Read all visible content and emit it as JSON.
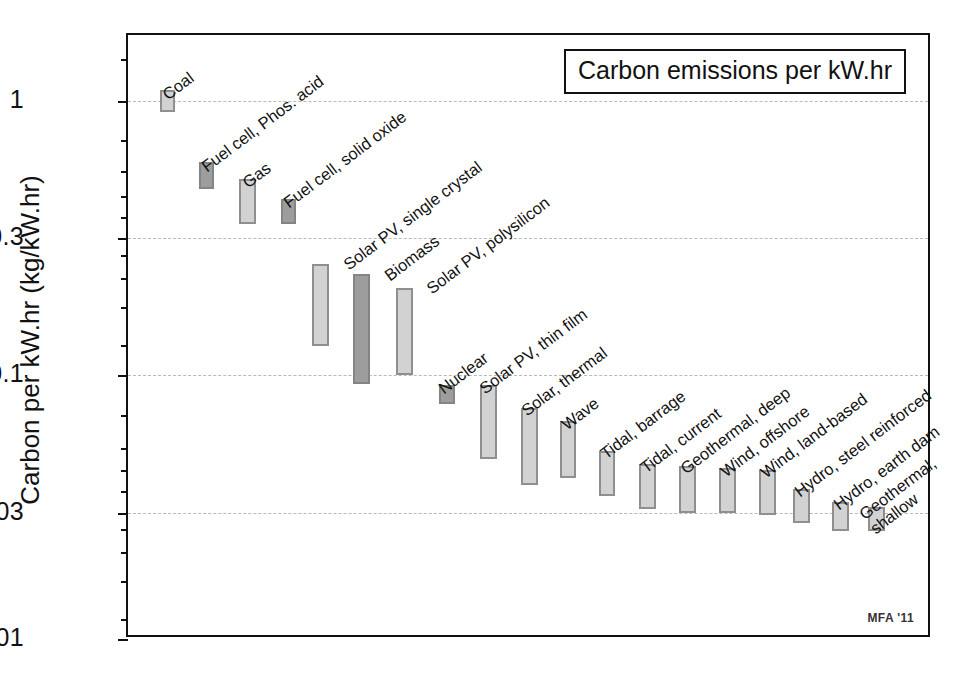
{
  "figure": {
    "title_box": "Carbon emissions per kW.hr",
    "credit": "MFA '11",
    "y_axis_title": "Carbon per kW.hr (kg/kW.hr)"
  },
  "chart_data": {
    "type": "bar",
    "subtype": "floating-range-bar",
    "title": "Carbon emissions per kW.hr",
    "xlabel": "",
    "ylabel": "Carbon per kW.hr (kg/kW.hr)",
    "yscale": "log",
    "ylim": [
      0.01,
      1.7
    ],
    "ytick_labels": [
      "1",
      "0.3",
      "0.1",
      "0.03",
      "0.01"
    ],
    "ytick_values": [
      1,
      0.3,
      0.1,
      0.03,
      0.01
    ],
    "grid": true,
    "grid_style": "dashed-horizontal",
    "legend": "none",
    "units": "kg CO2 per kW.hr",
    "categories": [
      "Coal",
      "Fuel cell, Phos. acid",
      "Gas",
      "Fuel cell, solid oxide",
      "Solar PV, single crystal",
      "Biomass",
      "Solar PV, polysilicon",
      "Nuclear",
      "Solar PV, thin film",
      "Solar, thermal",
      "Wave",
      "Tidal, barrage",
      "Tidal, current",
      "Geothermal, deep",
      "Wind, offshore",
      "Wind, land-based",
      "Hydro, steel reinforced",
      "Hydro, earth dam",
      "Geothermal, shallow"
    ],
    "ranges": [
      {
        "label": "Coal",
        "low": 0.93,
        "high": 1.12,
        "shade": "light"
      },
      {
        "label": "Fuel cell, Phos. acid",
        "low": 0.47,
        "high": 0.57,
        "shade": "dark"
      },
      {
        "label": "Gas",
        "low": 0.335,
        "high": 0.52,
        "shade": "light"
      },
      {
        "label": "Fuel cell, solid oxide",
        "low": 0.335,
        "high": 0.405,
        "shade": "dark"
      },
      {
        "label": "Solar PV, single crystal",
        "low": 0.125,
        "high": 0.245,
        "shade": "light"
      },
      {
        "label": "Biomass",
        "low": 0.085,
        "high": 0.24,
        "shade": "dark"
      },
      {
        "label": "Solar PV, polysilicon",
        "low": 0.1,
        "high": 0.215,
        "shade": "light"
      },
      {
        "label": "Nuclear",
        "low": 0.073,
        "high": 0.092,
        "shade": "dark"
      },
      {
        "label": "Solar PV, thin film",
        "low": 0.05,
        "high": 0.092,
        "shade": "light"
      },
      {
        "label": "Solar, thermal",
        "low": 0.04,
        "high": 0.074,
        "shade": "light"
      },
      {
        "label": "Wave",
        "low": 0.04,
        "high": 0.06,
        "shade": "light"
      },
      {
        "label": "Tidal, barrage",
        "low": 0.033,
        "high": 0.047,
        "shade": "light"
      },
      {
        "label": "Tidal, current",
        "low": 0.034,
        "high": 0.045,
        "shade": "light"
      },
      {
        "label": "Geothermal, deep",
        "low": 0.033,
        "high": 0.044,
        "shade": "light"
      },
      {
        "label": "Wind, offshore",
        "low": 0.033,
        "high": 0.043,
        "shade": "light"
      },
      {
        "label": "Wind, land-based",
        "low": 0.032,
        "high": 0.043,
        "shade": "light"
      },
      {
        "label": "Hydro, steel reinforced",
        "low": 0.0295,
        "high": 0.038,
        "shade": "light"
      },
      {
        "label": "Hydro, earth dam",
        "low": 0.0275,
        "high": 0.033,
        "shade": "light"
      },
      {
        "label": "Geothermal, shallow",
        "low": 0.0262,
        "high": 0.0305,
        "shade": "light"
      }
    ]
  },
  "bars": [
    {
      "x": 158,
      "w": 15,
      "top": 88,
      "bottom": 110,
      "shade": "light",
      "label": "Coal",
      "lx": 168,
      "ly": 84,
      "lines": [
        "Coal"
      ]
    },
    {
      "x": 197,
      "w": 15,
      "top": 160,
      "bottom": 187,
      "shade": "dark",
      "label": "Fuel cell, Phos. acid",
      "lx": 207,
      "ly": 156,
      "lines": [
        "Fuel cell, Phos. acid"
      ]
    },
    {
      "x": 237,
      "w": 17,
      "top": 177,
      "bottom": 222,
      "shade": "light",
      "label": "Gas",
      "lx": 248,
      "ly": 172,
      "lines": [
        "Gas"
      ]
    },
    {
      "x": 279,
      "w": 15,
      "top": 197,
      "bottom": 222,
      "shade": "dark",
      "label": "Fuel cell, solid oxide",
      "lx": 289,
      "ly": 192,
      "lines": [
        "Fuel cell, solid oxide"
      ]
    },
    {
      "x": 310,
      "w": 17,
      "top": 262,
      "bottom": 344,
      "shade": "light",
      "label": "Solar PV, single crystal",
      "lx": 349,
      "ly": 254,
      "lines": [
        "Solar PV, single crystal"
      ]
    },
    {
      "x": 351,
      "w": 17,
      "top": 272,
      "bottom": 382,
      "shade": "dark",
      "label": "Biomass",
      "lx": 390,
      "ly": 265,
      "lines": [
        "Biomass"
      ]
    },
    {
      "x": 394,
      "w": 17,
      "top": 286,
      "bottom": 373,
      "shade": "light",
      "label": "Solar PV, polysilicon",
      "lx": 432,
      "ly": 278,
      "lines": [
        "Solar PV, polysilicon"
      ]
    },
    {
      "x": 437,
      "w": 16,
      "top": 383,
      "bottom": 402,
      "shade": "dark",
      "label": "Nuclear",
      "lx": 444,
      "ly": 378,
      "lines": [
        "Nuclear"
      ]
    },
    {
      "x": 478,
      "w": 17,
      "top": 383,
      "bottom": 457,
      "shade": "light",
      "label": "Solar PV, thin film",
      "lx": 485,
      "ly": 378,
      "lines": [
        "Solar PV, thin film"
      ]
    },
    {
      "x": 519,
      "w": 17,
      "top": 406,
      "bottom": 483,
      "shade": "light",
      "label": "Solar, thermal",
      "lx": 527,
      "ly": 400,
      "lines": [
        "Solar, thermal"
      ]
    },
    {
      "x": 558,
      "w": 16,
      "top": 419,
      "bottom": 476,
      "shade": "light",
      "label": "Wave",
      "lx": 567,
      "ly": 414,
      "lines": [
        "Wave"
      ]
    },
    {
      "x": 597,
      "w": 16,
      "top": 449,
      "bottom": 494,
      "shade": "light",
      "label": "Tidal, barrage",
      "lx": 606,
      "ly": 443,
      "lines": [
        "Tidal, barrage"
      ]
    },
    {
      "x": 637,
      "w": 17,
      "top": 462,
      "bottom": 507,
      "shade": "light",
      "label": "Tidal, current",
      "lx": 646,
      "ly": 457,
      "lines": [
        "Tidal, current"
      ]
    },
    {
      "x": 677,
      "w": 17,
      "top": 464,
      "bottom": 511,
      "shade": "light",
      "label": "Geothermal, deep",
      "lx": 686,
      "ly": 458,
      "lines": [
        "Geothermal, deep"
      ]
    },
    {
      "x": 717,
      "w": 17,
      "top": 466,
      "bottom": 511,
      "shade": "light",
      "label": "Wind, offshore",
      "lx": 726,
      "ly": 461,
      "lines": [
        "Wind, offshore"
      ]
    },
    {
      "x": 757,
      "w": 17,
      "top": 468,
      "bottom": 513,
      "shade": "light",
      "label": "Wind, land-based",
      "lx": 766,
      "ly": 462,
      "lines": [
        "Wind, land-based"
      ]
    },
    {
      "x": 791,
      "w": 17,
      "top": 487,
      "bottom": 521,
      "shade": "light",
      "label": "Hydro, steel reinforced",
      "lx": 800,
      "ly": 481,
      "lines": [
        "Hydro, steel reinforced"
      ]
    },
    {
      "x": 830,
      "w": 17,
      "top": 500,
      "bottom": 529,
      "shade": "light",
      "label": "Hydro, earth dam",
      "lx": 839,
      "ly": 494,
      "lines": [
        "Hydro, earth dam"
      ]
    },
    {
      "x": 866,
      "w": 17,
      "top": 505,
      "bottom": 529,
      "shade": "light",
      "label": "Geothermal, shallow",
      "lx": 876,
      "ly": 499,
      "lines": [
        "Geothermal,",
        "shallow"
      ]
    }
  ],
  "axis": {
    "major_ticks": [
      {
        "label": "1",
        "y": 99
      },
      {
        "label": "0.3",
        "y": 236
      },
      {
        "label": "0.1",
        "y": 373
      },
      {
        "label": "0.03",
        "y": 511
      },
      {
        "label": "0.01",
        "y": 637
      }
    ],
    "minor_tick_y": [
      57,
      138,
      169,
      194,
      215,
      253,
      276,
      305,
      343,
      413,
      446,
      468,
      489,
      527,
      550,
      579,
      617
    ]
  }
}
